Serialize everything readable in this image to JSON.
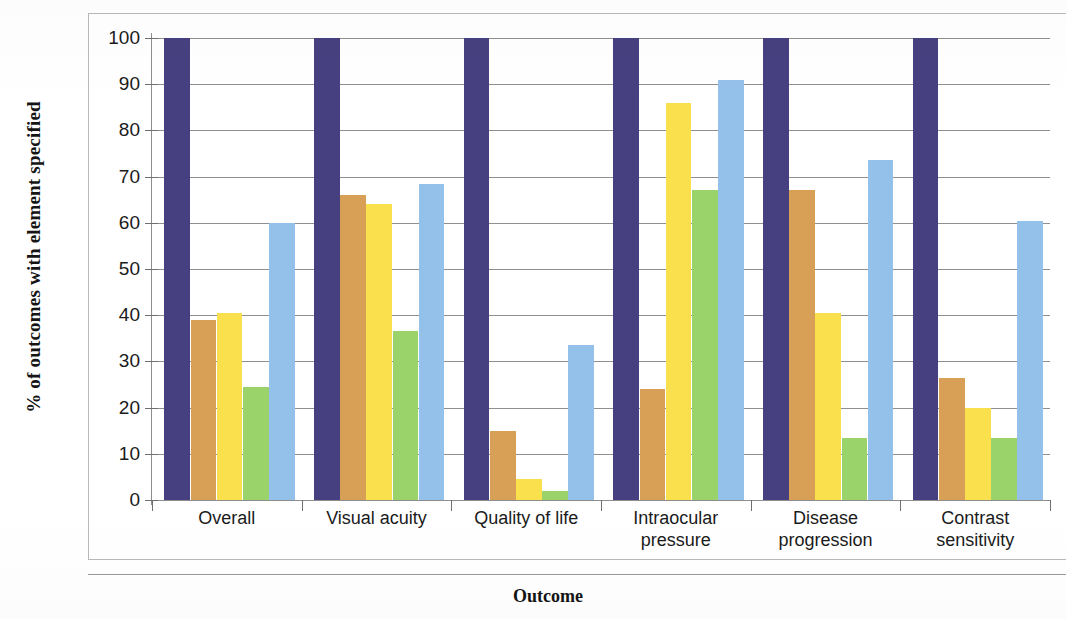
{
  "chart_data": {
    "type": "bar",
    "title": "",
    "xlabel": "Outcome",
    "ylabel": "% of outcomes with element specified",
    "ylim": [
      0,
      100
    ],
    "ytick_values": [
      0,
      10,
      20,
      30,
      40,
      50,
      60,
      70,
      80,
      90,
      100
    ],
    "ytick_labels": [
      "0",
      "10",
      "20",
      "30",
      "40",
      "50",
      "60",
      "70",
      "80",
      "90",
      "100"
    ],
    "grid": true,
    "legend": "none",
    "categories": [
      "Overall",
      "Visual acuity",
      "Quality of life",
      "Intraocular pressure",
      "Disease progression",
      "Contrast sensitivity"
    ],
    "category_lines": [
      [
        "Overall"
      ],
      [
        "Visual acuity"
      ],
      [
        "Quality of life"
      ],
      [
        "Intraocular",
        "pressure"
      ],
      [
        "Disease",
        "progression"
      ],
      [
        "Contrast",
        "sensitivity"
      ]
    ],
    "series": [
      {
        "name": "series-1",
        "color": "#474080",
        "values": [
          100,
          100,
          100,
          100,
          100,
          100
        ]
      },
      {
        "name": "series-2",
        "color": "#d89f57",
        "values": [
          39,
          66,
          15,
          24,
          67,
          26.5
        ]
      },
      {
        "name": "series-3",
        "color": "#fbe04e",
        "values": [
          40.5,
          64,
          4.5,
          86,
          40.5,
          20
        ]
      },
      {
        "name": "series-4",
        "color": "#9ad36a",
        "values": [
          24.5,
          36.5,
          2,
          67,
          13.5,
          13.5
        ]
      },
      {
        "name": "series-5",
        "color": "#94c1ea",
        "values": [
          60,
          68.5,
          33.5,
          91,
          73.5,
          60.5
        ]
      }
    ]
  },
  "colors": {
    "navy": "#474080",
    "tan": "#d89f57",
    "yellow": "#fbe04e",
    "green": "#9ad36a",
    "lightblue": "#94c1ea",
    "gridline": "#8f8f8f",
    "axis": "#8d8d8d",
    "frame": "#b9b9b9",
    "text": "#1b1b1b"
  }
}
